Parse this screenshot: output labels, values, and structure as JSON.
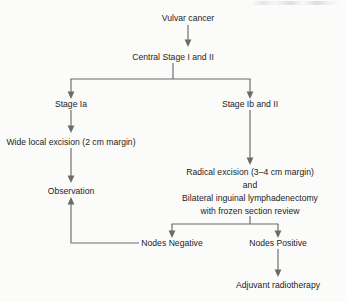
{
  "figure": {
    "type": "flowchart",
    "orientation": "top-down",
    "background_color": "#fbfbfa",
    "line_color": "#6b6b6b",
    "text_color": "#1c1c1c"
  },
  "nodes": {
    "vulvar_cancer": "Vulvar cancer",
    "central_stage": "Central Stage I and II",
    "stage_ia": "Stage Ia",
    "stage_ib_ii": "Stage Ib and II",
    "wide_local_excision": "Wide local excision (2 cm margin)",
    "observation": "Observation",
    "radical_excision_line1": "Radical excision (3–4 cm margin)",
    "radical_excision_line2": "and",
    "radical_excision_line3": "Bilateral inguinal lymphadenectomy",
    "radical_excision_line4": "with frozen section review",
    "nodes_negative": "Nodes Negative",
    "nodes_positive": "Nodes Positive",
    "adjuvant_radiotherapy": "Adjuvant radiotherapy"
  },
  "edges": [
    {
      "from": "vulvar_cancer",
      "to": "central_stage",
      "style": "arrow-down"
    },
    {
      "from": "central_stage",
      "to": "stage_ia",
      "style": "branch-left"
    },
    {
      "from": "central_stage",
      "to": "stage_ib_ii",
      "style": "branch-right"
    },
    {
      "from": "stage_ia",
      "to": "wide_local_excision",
      "style": "arrow-down"
    },
    {
      "from": "wide_local_excision",
      "to": "observation",
      "style": "arrow-down"
    },
    {
      "from": "stage_ib_ii",
      "to": "radical_excision_line1",
      "style": "arrow-down"
    },
    {
      "from": "radical_excision_line4",
      "to": "nodes_negative",
      "style": "branch-left"
    },
    {
      "from": "radical_excision_line4",
      "to": "nodes_positive",
      "style": "branch-right"
    },
    {
      "from": "nodes_negative",
      "to": "observation",
      "style": "elbow-left-up"
    },
    {
      "from": "nodes_positive",
      "to": "adjuvant_radiotherapy",
      "style": "arrow-down"
    }
  ]
}
